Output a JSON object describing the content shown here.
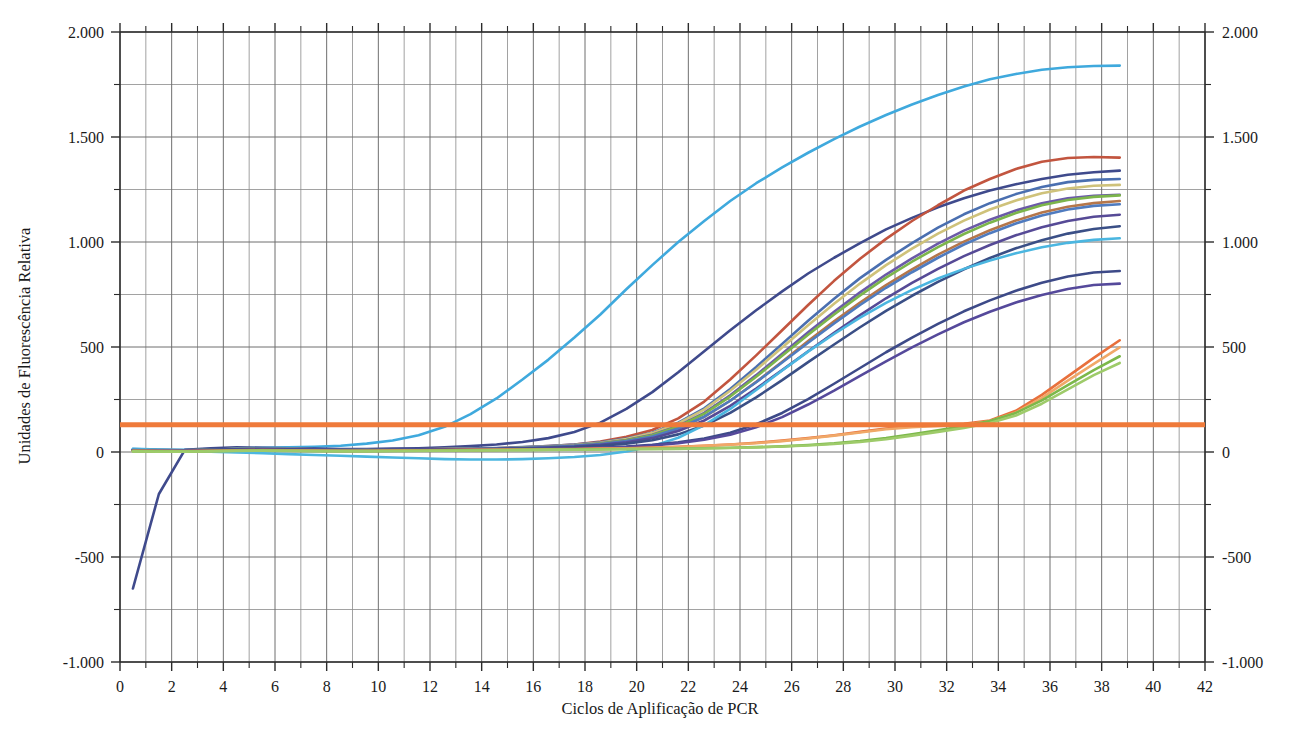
{
  "chart_data": {
    "type": "line",
    "title": "",
    "xlabel": "Ciclos de Aplificação de PCR",
    "ylabel": "Unidades de Fluorescência Relativa",
    "xlim": [
      0,
      42
    ],
    "ylim": [
      -1000,
      2000
    ],
    "grid": true,
    "legend": "none",
    "x_ticks": [
      0,
      2,
      4,
      6,
      8,
      10,
      12,
      14,
      16,
      18,
      20,
      22,
      24,
      26,
      28,
      30,
      32,
      34,
      36,
      38,
      40,
      42
    ],
    "x_tick_labels": [
      "0",
      "2",
      "4",
      "6",
      "8",
      "10",
      "12",
      "14",
      "16",
      "18",
      "20",
      "22",
      "24",
      "26",
      "28",
      "30",
      "32",
      "34",
      "36",
      "38",
      "40",
      "42"
    ],
    "x_minor_step": 1,
    "y_ticks": [
      -1000,
      -500,
      0,
      500,
      1000,
      1500,
      2000
    ],
    "y_tick_labels_left": [
      "-1.000",
      "-500",
      "0",
      "500",
      "1.000",
      "1.500",
      "2.000"
    ],
    "y_tick_labels_right": [
      "-1.000",
      "-500",
      "0",
      "500",
      "1.000",
      "1.500",
      "2.000"
    ],
    "y_minor_step": 250,
    "x_data_start": 0.5,
    "x_data_end": 38.7,
    "threshold": {
      "name": "threshold-line",
      "value": 130,
      "color": "#ef7a3a",
      "label": ""
    },
    "annotations": [],
    "series": [
      {
        "name": "amostra-01-ciano-precoce",
        "color": "#3fa9dd",
        "ct": 13.0,
        "values": [
          15,
          12,
          10,
          14,
          18,
          20,
          22,
          25,
          30,
          40,
          55,
          80,
          120,
          180,
          255,
          345,
          440,
          545,
          655,
          775,
          890,
          1000,
          1100,
          1195,
          1280,
          1355,
          1425,
          1490,
          1550,
          1605,
          1655,
          1700,
          1740,
          1775,
          1800,
          1820,
          1832,
          1838,
          1840
        ]
      },
      {
        "name": "amostra-02-azul-marinho",
        "color": "#3f4a8c",
        "ct": 18.5,
        "values": [
          -650,
          -200,
          10,
          18,
          22,
          20,
          18,
          16,
          14,
          14,
          16,
          18,
          22,
          28,
          36,
          48,
          66,
          95,
          140,
          205,
          285,
          380,
          480,
          580,
          675,
          765,
          850,
          925,
          995,
          1060,
          1115,
          1165,
          1208,
          1245,
          1275,
          1300,
          1320,
          1332,
          1340
        ]
      },
      {
        "name": "amostra-03-vermelho-tijolo",
        "color": "#c2553f",
        "ct": 21.5,
        "values": [
          8,
          6,
          5,
          8,
          12,
          14,
          14,
          12,
          10,
          10,
          11,
          13,
          14,
          16,
          18,
          22,
          28,
          36,
          50,
          72,
          105,
          160,
          240,
          345,
          460,
          580,
          700,
          815,
          920,
          1015,
          1100,
          1175,
          1245,
          1300,
          1348,
          1382,
          1400,
          1405,
          1402
        ]
      },
      {
        "name": "amostra-04-azul-aco",
        "color": "#4a6fb0",
        "ct": 21.8,
        "values": [
          10,
          8,
          7,
          10,
          14,
          16,
          15,
          13,
          11,
          11,
          12,
          13,
          15,
          17,
          19,
          23,
          28,
          35,
          46,
          64,
          92,
          140,
          208,
          300,
          405,
          515,
          625,
          730,
          828,
          915,
          995,
          1068,
          1132,
          1185,
          1228,
          1262,
          1285,
          1296,
          1300
        ]
      },
      {
        "name": "amostra-05-cáqui",
        "color": "#cfc27a",
        "ct": 22.2,
        "values": [
          12,
          9,
          8,
          11,
          15,
          16,
          15,
          13,
          11,
          10,
          11,
          12,
          14,
          16,
          18,
          21,
          26,
          33,
          44,
          62,
          90,
          136,
          202,
          292,
          392,
          498,
          604,
          706,
          802,
          890,
          968,
          1040,
          1102,
          1155,
          1198,
          1232,
          1255,
          1268,
          1272
        ]
      },
      {
        "name": "amostra-06-roxo",
        "color": "#6b5aa8",
        "ct": 22.5,
        "values": [
          9,
          7,
          6,
          9,
          13,
          15,
          14,
          12,
          10,
          10,
          11,
          12,
          13,
          15,
          17,
          20,
          25,
          31,
          41,
          57,
          82,
          124,
          186,
          270,
          366,
          468,
          570,
          668,
          760,
          845,
          922,
          992,
          1054,
          1106,
          1150,
          1184,
          1208,
          1220,
          1225
        ]
      },
      {
        "name": "amostra-07-verde",
        "color": "#7cb54b",
        "ct": 22.6,
        "values": [
          11,
          8,
          7,
          10,
          14,
          15,
          14,
          12,
          10,
          9,
          10,
          11,
          13,
          14,
          16,
          19,
          24,
          30,
          40,
          56,
          80,
          122,
          182,
          264,
          358,
          458,
          558,
          655,
          746,
          830,
          906,
          976,
          1038,
          1092,
          1138,
          1175,
          1200,
          1215,
          1222
        ]
      },
      {
        "name": "amostra-08-marrom-claro",
        "color": "#b5764a",
        "ct": 22.9,
        "values": [
          10,
          8,
          6,
          9,
          13,
          14,
          13,
          11,
          9,
          9,
          10,
          11,
          12,
          14,
          15,
          18,
          22,
          28,
          37,
          51,
          73,
          111,
          167,
          244,
          334,
          430,
          528,
          622,
          712,
          795,
          870,
          940,
          1002,
          1056,
          1102,
          1140,
          1168,
          1185,
          1195
        ]
      },
      {
        "name": "amostra-09-azul-medio",
        "color": "#4f7bbf",
        "ct": 23.2,
        "values": [
          12,
          10,
          8,
          11,
          15,
          16,
          15,
          13,
          11,
          10,
          11,
          12,
          13,
          15,
          16,
          19,
          23,
          29,
          38,
          52,
          74,
          112,
          168,
          244,
          332,
          426,
          520,
          612,
          700,
          782,
          856,
          925,
          988,
          1042,
          1088,
          1126,
          1155,
          1172,
          1180
        ]
      },
      {
        "name": "amostra-10-roxo-escuro",
        "color": "#564a96",
        "ct": 23.5,
        "values": [
          9,
          7,
          6,
          9,
          12,
          13,
          12,
          11,
          9,
          9,
          10,
          11,
          12,
          13,
          15,
          17,
          21,
          26,
          34,
          46,
          66,
          100,
          150,
          220,
          302,
          390,
          480,
          568,
          652,
          732,
          805,
          872,
          933,
          986,
          1032,
          1070,
          1100,
          1120,
          1130
        ]
      },
      {
        "name": "amostra-11-azul-escuro",
        "color": "#3a4f86",
        "ct": 24.2,
        "values": [
          10,
          8,
          7,
          10,
          13,
          14,
          13,
          11,
          10,
          9,
          10,
          11,
          12,
          13,
          14,
          16,
          19,
          23,
          30,
          40,
          56,
          84,
          126,
          186,
          260,
          342,
          428,
          512,
          594,
          672,
          744,
          810,
          870,
          924,
          970,
          1008,
          1040,
          1062,
          1075
        ]
      },
      {
        "name": "amostra-12-ciano-medio",
        "color": "#4bb6e0",
        "ct": 24.8,
        "values": [
          14,
          10,
          6,
          2,
          -2,
          -6,
          -10,
          -14,
          -18,
          -22,
          -26,
          -30,
          -34,
          -36,
          -36,
          -34,
          -30,
          -24,
          -14,
          2,
          28,
          68,
          128,
          205,
          295,
          388,
          478,
          562,
          640,
          710,
          772,
          826,
          872,
          912,
          946,
          975,
          996,
          1010,
          1018
        ]
      },
      {
        "name": "amostra-13-azul-marinho-tardio",
        "color": "#3d4a88",
        "ct": 27.5,
        "values": [
          8,
          6,
          5,
          7,
          10,
          11,
          10,
          9,
          8,
          8,
          9,
          10,
          11,
          12,
          13,
          14,
          16,
          18,
          21,
          26,
          34,
          46,
          64,
          92,
          132,
          186,
          252,
          325,
          400,
          475,
          545,
          610,
          670,
          722,
          768,
          806,
          836,
          855,
          862
        ]
      },
      {
        "name": "amostra-14-roxo-tardio",
        "color": "#55499b",
        "ct": 28.3,
        "values": [
          9,
          7,
          6,
          8,
          11,
          12,
          11,
          10,
          9,
          8,
          9,
          10,
          11,
          12,
          13,
          14,
          15,
          17,
          20,
          24,
          31,
          42,
          58,
          82,
          118,
          166,
          226,
          292,
          362,
          432,
          498,
          560,
          618,
          668,
          712,
          748,
          776,
          795,
          802
        ]
      },
      {
        "name": "amostra-15-laranja-tardio",
        "color": "#e8703c",
        "ct": 34.0,
        "values": [
          6,
          5,
          4,
          6,
          8,
          9,
          8,
          7,
          6,
          6,
          7,
          8,
          9,
          10,
          11,
          12,
          13,
          14,
          16,
          18,
          21,
          25,
          30,
          36,
          44,
          54,
          66,
          80,
          96,
          112,
          122,
          128,
          134,
          150,
          196,
          272,
          360,
          448,
          532
        ]
      },
      {
        "name": "amostra-16-laranja-claro-tardio",
        "color": "#f0a868",
        "ct": 34.4,
        "values": [
          5,
          4,
          3,
          5,
          7,
          8,
          7,
          6,
          5,
          5,
          6,
          7,
          8,
          9,
          10,
          11,
          12,
          13,
          15,
          17,
          20,
          24,
          29,
          35,
          42,
          52,
          64,
          78,
          93,
          108,
          118,
          124,
          130,
          146,
          188,
          258,
          340,
          420,
          498
        ]
      },
      {
        "name": "amostra-17-verde-tardio",
        "color": "#7cb84a",
        "ct": 34.8,
        "values": [
          4,
          3,
          2,
          4,
          6,
          7,
          6,
          5,
          4,
          4,
          5,
          6,
          7,
          8,
          9,
          10,
          11,
          12,
          13,
          14,
          15,
          16,
          18,
          20,
          23,
          27,
          33,
          41,
          52,
          66,
          84,
          104,
          124,
          148,
          186,
          246,
          318,
          390,
          456
        ]
      },
      {
        "name": "amostra-18-verde-claro-tardio",
        "color": "#9ecb6a",
        "ct": 35.2,
        "values": [
          3,
          2,
          2,
          3,
          5,
          6,
          5,
          4,
          4,
          4,
          5,
          5,
          6,
          7,
          8,
          9,
          10,
          11,
          12,
          13,
          14,
          15,
          17,
          19,
          22,
          26,
          31,
          38,
          48,
          61,
          78,
          96,
          115,
          138,
          174,
          230,
          298,
          366,
          424
        ]
      }
    ]
  }
}
